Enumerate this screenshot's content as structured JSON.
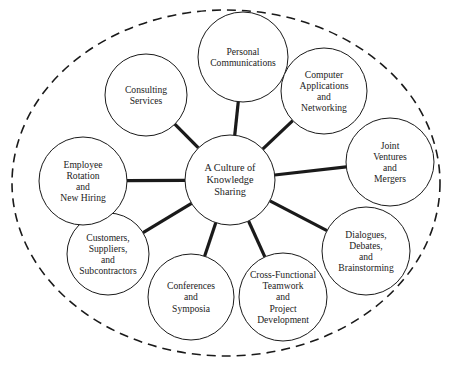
{
  "diagram": {
    "type": "hub-and-spoke",
    "colors": {
      "background": "#ffffff",
      "stroke": "#1a1a1a",
      "text": "#222222"
    },
    "boundary": {
      "style": "dashed-ellipse",
      "cx": 226,
      "cy": 183,
      "rx": 214,
      "ry": 173
    },
    "center": {
      "id": "knowledge-sharing",
      "lines": [
        "A Culture of",
        "Knowledge",
        "Sharing"
      ],
      "cx": 230,
      "cy": 180,
      "r": 45
    },
    "nodes": [
      {
        "id": "consulting-services",
        "lines": [
          "Consulting",
          "Services"
        ],
        "cx": 146,
        "cy": 95,
        "r": 41
      },
      {
        "id": "personal-communications",
        "lines": [
          "Personal",
          "Communications"
        ],
        "cx": 243,
        "cy": 57,
        "r": 45
      },
      {
        "id": "computer-applications",
        "lines": [
          "Computer",
          "Applications",
          "and",
          "Networking"
        ],
        "cx": 324,
        "cy": 91,
        "r": 43
      },
      {
        "id": "joint-ventures",
        "lines": [
          "Joint",
          "Ventures",
          "and",
          "Mergers"
        ],
        "cx": 390,
        "cy": 162,
        "r": 44
      },
      {
        "id": "dialogues-debates",
        "lines": [
          "Dialogues,",
          "Debates,",
          "and",
          "Brainstorming"
        ],
        "cx": 366,
        "cy": 251,
        "r": 44
      },
      {
        "id": "cross-functional-teamwork",
        "lines": [
          "Cross-Functional",
          "Teamwork",
          "and",
          "Project",
          "Development"
        ],
        "cx": 283,
        "cy": 297,
        "r": 44
      },
      {
        "id": "conferences-symposia",
        "lines": [
          "Conferences",
          "and",
          "Symposia"
        ],
        "cx": 191,
        "cy": 297,
        "r": 43
      },
      {
        "id": "customers-suppliers",
        "lines": [
          "Customers,",
          "Suppliers,",
          "and",
          "Subcontractors"
        ],
        "cx": 108,
        "cy": 254,
        "r": 41
      },
      {
        "id": "employee-rotation",
        "lines": [
          "Employee",
          "Rotation",
          "and",
          "New Hiring"
        ],
        "cx": 83,
        "cy": 181,
        "r": 44
      }
    ]
  }
}
